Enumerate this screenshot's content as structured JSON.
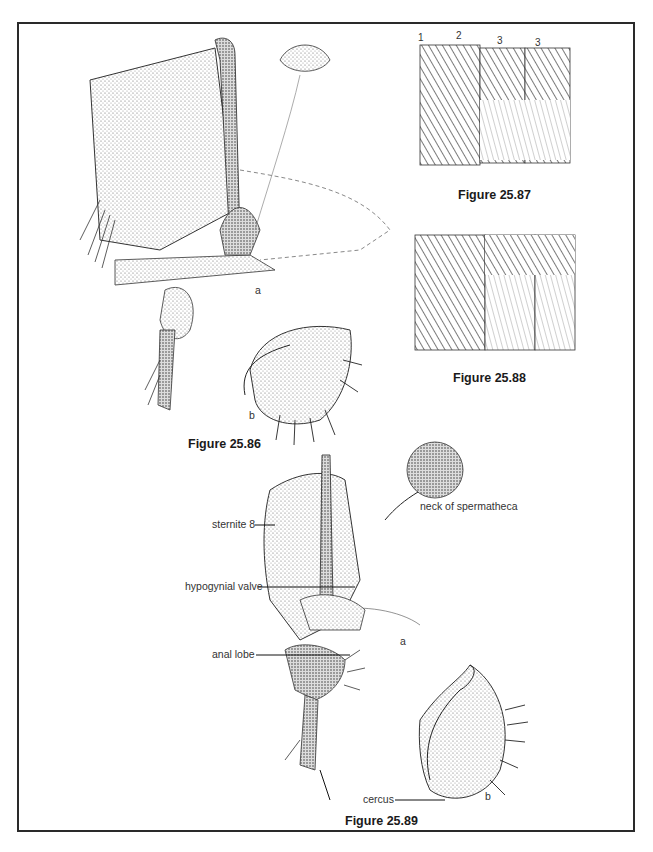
{
  "plate": {
    "figures": [
      {
        "id": "fig-25-86",
        "caption": "Figure 25.86",
        "parts": [
          "a",
          "b"
        ]
      },
      {
        "id": "fig-25-87",
        "caption": "Figure 25.87",
        "segment_numbers": [
          "1",
          "2",
          "3",
          "3"
        ]
      },
      {
        "id": "fig-25-88",
        "caption": "Figure 25.88"
      },
      {
        "id": "fig-25-89",
        "caption": "Figure 25.89",
        "parts": [
          "a",
          "b"
        ],
        "labels": {
          "sternite": "sternite 8",
          "spermatheca": "neck of spermatheca",
          "hypogynial": "hypogynial valve",
          "anal_lobe": "anal lobe",
          "cercus": "cercus"
        }
      }
    ]
  }
}
